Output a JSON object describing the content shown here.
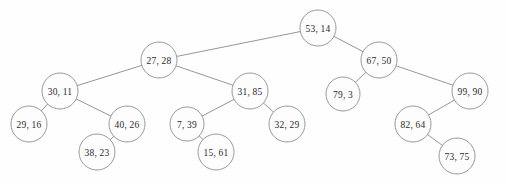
{
  "figure": {
    "name": "binary-search-tree-treap-diagram",
    "background_color": "#fefefe",
    "node_fill": "#fdfdfd",
    "node_stroke": "#8f8f8f",
    "edge_color": "#8a8a8a",
    "text_color": "#2b2b2b",
    "width": 507,
    "height": 184
  },
  "nodes": [
    {
      "id": "n53",
      "label": "53, 14",
      "key": 53,
      "priority": 14,
      "cx": 318,
      "cy": 28,
      "r": 18,
      "depth": 0
    },
    {
      "id": "n27",
      "label": "27, 28",
      "key": 27,
      "priority": 28,
      "cx": 159,
      "cy": 60,
      "r": 18,
      "depth": 1
    },
    {
      "id": "n67",
      "label": "67, 50",
      "key": 67,
      "priority": 50,
      "cx": 379,
      "cy": 60,
      "r": 18,
      "depth": 1
    },
    {
      "id": "n30",
      "label": "30, 11",
      "key": 30,
      "priority": 11,
      "cx": 60,
      "cy": 91,
      "r": 18,
      "depth": 2
    },
    {
      "id": "n31",
      "label": "31, 85",
      "key": 31,
      "priority": 85,
      "cx": 250,
      "cy": 91,
      "r": 18,
      "depth": 2
    },
    {
      "id": "n79",
      "label": "79, 3",
      "key": 79,
      "priority": 3,
      "cx": 343,
      "cy": 94,
      "r": 17,
      "depth": 2
    },
    {
      "id": "n99",
      "label": "99, 90",
      "key": 99,
      "priority": 90,
      "cx": 470,
      "cy": 91,
      "r": 18,
      "depth": 2
    },
    {
      "id": "n29",
      "label": "29, 16",
      "key": 29,
      "priority": 16,
      "cx": 29,
      "cy": 124,
      "r": 18,
      "depth": 3
    },
    {
      "id": "n40",
      "label": "40, 26",
      "key": 40,
      "priority": 26,
      "cx": 127,
      "cy": 124,
      "r": 18,
      "depth": 3
    },
    {
      "id": "n7",
      "label": "7, 39",
      "key": 7,
      "priority": 39,
      "cx": 187,
      "cy": 124,
      "r": 17,
      "depth": 3
    },
    {
      "id": "n32",
      "label": "32, 29",
      "key": 32,
      "priority": 29,
      "cx": 287,
      "cy": 124,
      "r": 18,
      "depth": 3
    },
    {
      "id": "n82",
      "label": "82, 64",
      "key": 82,
      "priority": 64,
      "cx": 413,
      "cy": 124,
      "r": 18,
      "depth": 3
    },
    {
      "id": "n38",
      "label": "38, 23",
      "key": 38,
      "priority": 23,
      "cx": 97,
      "cy": 152,
      "r": 18,
      "depth": 4
    },
    {
      "id": "n15",
      "label": "15, 61",
      "key": 15,
      "priority": 61,
      "cx": 216,
      "cy": 152,
      "r": 18,
      "depth": 4
    },
    {
      "id": "n73",
      "label": "73, 75",
      "key": 73,
      "priority": 75,
      "cx": 457,
      "cy": 156,
      "r": 18,
      "depth": 4
    }
  ],
  "edges": [
    {
      "from": "n53",
      "to": "n27"
    },
    {
      "from": "n53",
      "to": "n67"
    },
    {
      "from": "n27",
      "to": "n30"
    },
    {
      "from": "n27",
      "to": "n31"
    },
    {
      "from": "n67",
      "to": "n79"
    },
    {
      "from": "n67",
      "to": "n99"
    },
    {
      "from": "n30",
      "to": "n29"
    },
    {
      "from": "n30",
      "to": "n40"
    },
    {
      "from": "n31",
      "to": "n7"
    },
    {
      "from": "n31",
      "to": "n32"
    },
    {
      "from": "n99",
      "to": "n82"
    },
    {
      "from": "n40",
      "to": "n38"
    },
    {
      "from": "n7",
      "to": "n15"
    },
    {
      "from": "n82",
      "to": "n73"
    }
  ]
}
